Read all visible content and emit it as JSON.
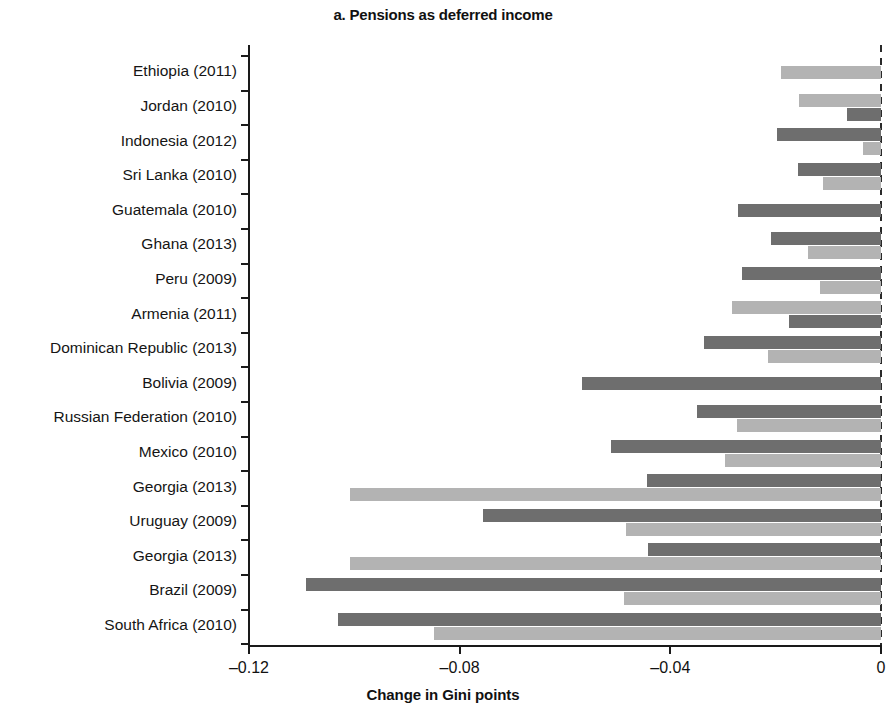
{
  "chart_data": {
    "type": "bar",
    "orientation": "horizontal",
    "title": "a. Pensions as deferred income",
    "xlabel": "Change in Gini points",
    "ylabel": "",
    "xlim": [
      -0.13,
      0.0
    ],
    "xticks": [
      -0.12,
      -0.08,
      -0.04,
      0
    ],
    "xticklabels": [
      "–0.12",
      "–0.08",
      "–0.04",
      "0"
    ],
    "grid": false,
    "zero_reference_line": true,
    "legend": "none",
    "categories": [
      "Ethiopia (2011)",
      "Jordan (2010)",
      "Indonesia (2012)",
      "Sri Lanka (2010)",
      "Guatemala (2010)",
      "Ghana (2013)",
      "Peru (2009)",
      "Armenia (2011)",
      "Dominican Republic (2013)",
      "Bolivia (2009)",
      "Russian Federation (2010)",
      "Mexico (2010)",
      "Georgia (2013)",
      "Uruguay (2009)",
      "Georgia (2013)",
      "Brazil (2009)",
      "South Africa (2010)"
    ],
    "series": [
      {
        "name": "series-light",
        "color": "#b3b3b3",
        "values": [
          -0.019,
          -0.0156,
          -0.0034,
          -0.011,
          null,
          -0.0139,
          -0.0116,
          -0.0282,
          -0.0215,
          null,
          -0.0274,
          -0.0297,
          -0.1008,
          -0.0484,
          -0.1008,
          -0.0488,
          -0.0848
        ]
      },
      {
        "name": "series-dark",
        "color": "#6e6e6e",
        "values": [
          null,
          -0.0065,
          -0.0198,
          -0.0158,
          -0.0272,
          -0.0208,
          -0.0263,
          -0.0175,
          -0.0337,
          -0.0568,
          -0.035,
          -0.0512,
          -0.0444,
          -0.0756,
          -0.0442,
          -0.1091,
          -0.103
        ]
      }
    ]
  }
}
